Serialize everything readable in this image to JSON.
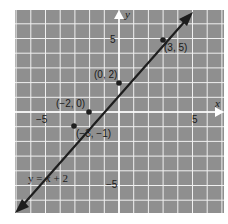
{
  "chart_data": {
    "type": "line",
    "title": "",
    "xlabel": "x",
    "ylabel": "y",
    "xlim": [
      -7,
      7
    ],
    "ylim": [
      -7,
      7
    ],
    "grid": true,
    "x_ticks": [
      {
        "value": -5,
        "label": "−5"
      },
      {
        "value": 5,
        "label": "5"
      }
    ],
    "y_ticks": [
      {
        "value": 5,
        "label": "5"
      },
      {
        "value": -5,
        "label": "−5"
      }
    ],
    "series": [
      {
        "name": "y = x + 2",
        "equation": "y = x + 2",
        "slope": 1,
        "intercept": 2,
        "x_range": [
          -7,
          4.2
        ]
      }
    ],
    "points": [
      {
        "x": 3,
        "y": 5,
        "label": "(3, 5)"
      },
      {
        "x": 0,
        "y": 2,
        "label": "(0, 2)"
      },
      {
        "x": -2,
        "y": 0,
        "label": "(−2, 0)"
      },
      {
        "x": -3,
        "y": -1,
        "label": "(−3, −1)"
      }
    ],
    "annotations": [
      {
        "text": "y = x + 2",
        "x": -6.6,
        "y": -6.3
      }
    ],
    "colors": {
      "grid_bg": "#8f8f8f",
      "grid_line": "#f2f2f2",
      "line": "#1e1e1e",
      "axis": "#ffffff"
    }
  },
  "labels": {
    "x_axis": "x",
    "y_axis": "y",
    "tick_x_neg5": "−5",
    "tick_x_pos5": "5",
    "tick_y_pos5": "5",
    "tick_y_neg5": "−5",
    "pt_3_5": "(3, 5)",
    "pt_0_2": "(0, 2)",
    "pt_m2_0": "(−2, 0)",
    "pt_m3_m1": "(−3, −1)",
    "equation": "y = x + 2"
  }
}
